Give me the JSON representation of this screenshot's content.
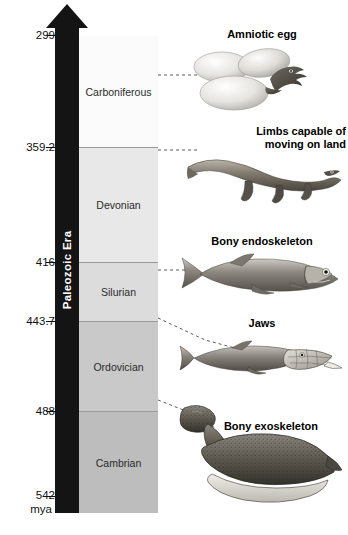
{
  "diagram": {
    "era_label": "Paleozoic Era",
    "time_unit": "mya",
    "axis_direction_icon": "up-arrow-icon"
  },
  "axis": {
    "ticks": [
      "299",
      "359.2",
      "416",
      "443.7",
      "488",
      "542"
    ],
    "unit_label": "mya"
  },
  "periods": [
    {
      "name": "Carboniferous",
      "top_mya": "299",
      "bottom_mya": "359.2",
      "shade": "#fbfbfb"
    },
    {
      "name": "Devonian",
      "top_mya": "359.2",
      "bottom_mya": "416",
      "shade": "#e8e8e8"
    },
    {
      "name": "Silurian",
      "top_mya": "416",
      "bottom_mya": "443.7",
      "shade": "#dcdcdc"
    },
    {
      "name": "Ordovician",
      "top_mya": "443.7",
      "bottom_mya": "488",
      "shade": "#c9c9c9"
    },
    {
      "name": "Cambrian",
      "top_mya": "488",
      "bottom_mya": "542",
      "shade": "#bdbdbd"
    }
  ],
  "features": [
    {
      "caption": "Amniotic egg",
      "icon": "amniotic-egg-illustration",
      "period": "Carboniferous"
    },
    {
      "caption_line1": "Limbs capable of",
      "caption_line2": "moving on land",
      "icon": "tetrapod-illustration",
      "period": "Devonian"
    },
    {
      "caption": "Bony endoskeleton",
      "icon": "bony-fish-illustration",
      "period": "Devonian"
    },
    {
      "caption": "Jaws",
      "icon": "jawed-fish-illustration",
      "period": "Silurian"
    },
    {
      "caption": "Bony exoskeleton",
      "icon": "ostracoderm-illustration",
      "period": "Ordovician"
    }
  ],
  "colors": {
    "era_bar": "#141414",
    "band_border": "#9a9a9a",
    "text": "#111111"
  }
}
